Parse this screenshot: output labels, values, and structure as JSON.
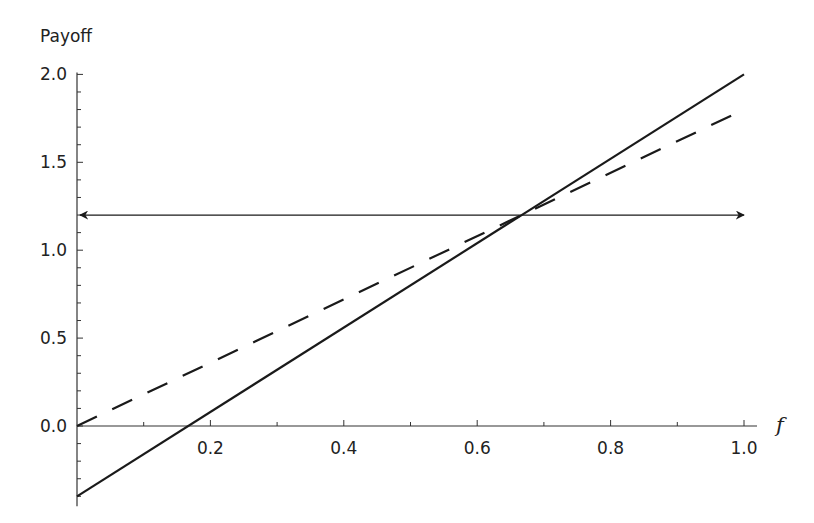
{
  "chart_data": {
    "type": "line",
    "title": "",
    "xlabel": "f",
    "ylabel": "Payoff",
    "xlim": [
      0,
      1.0
    ],
    "ylim": [
      -0.4,
      2.0
    ],
    "grid": false,
    "legend": null,
    "x_ticks": [
      0.2,
      0.4,
      0.6,
      0.8,
      1.0
    ],
    "x_tick_labels": [
      "0.2",
      "0.4",
      "0.6",
      "0.8",
      "1.0"
    ],
    "y_ticks": [
      0.0,
      0.5,
      1.0,
      1.5,
      2.0
    ],
    "y_tick_labels": [
      "0.0",
      "0.5",
      "1.0",
      "1.5",
      "2.0"
    ],
    "minor_tick_step": 0.1,
    "series": [
      {
        "name": "solid line",
        "style": "solid",
        "x": [
          0,
          1
        ],
        "values": [
          -0.4,
          2.0
        ]
      },
      {
        "name": "dashed line",
        "style": "dashed",
        "x": [
          0,
          1
        ],
        "values": [
          0.0,
          1.8
        ]
      },
      {
        "name": "horizontal double arrow",
        "style": "solid-double-arrow",
        "x": [
          0,
          1
        ],
        "values": [
          1.2,
          1.2
        ]
      }
    ],
    "annotations": [
      {
        "type": "intersection",
        "x": 0.667,
        "y": 1.2
      }
    ]
  },
  "colors": {
    "line": "#1a1a1a",
    "axis": "#333333",
    "background": "#ffffff"
  }
}
